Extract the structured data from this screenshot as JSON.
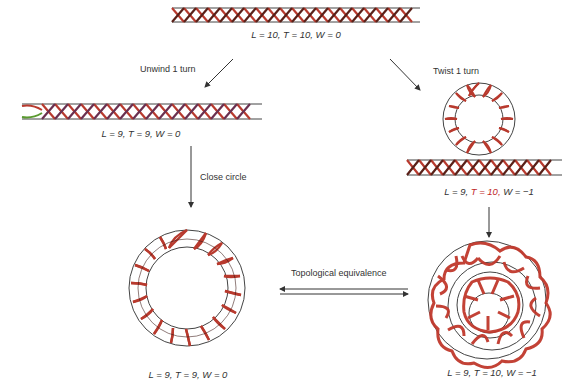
{
  "diagram": {
    "type": "dna-topology",
    "colors": {
      "strand": "#c0282a",
      "strand_dark": "#3a1512",
      "outline": "#444444",
      "text": "#333333",
      "highlight_T": "#c0282a"
    },
    "nodes": {
      "top": {
        "label_L": "L = 10,",
        "label_T": "T = 10,",
        "label_W": "W = 0",
        "shape": "linear-helix"
      },
      "unwound": {
        "label_L": "L = 9,",
        "label_T": "T = 9,",
        "label_W": "W = 0",
        "shape": "linear-helix"
      },
      "twisted": {
        "label_L": "L = 9,",
        "label_T": "T = 10,",
        "label_W": "W = −1",
        "shape": "helix-with-loop"
      },
      "relaxed_circle": {
        "label_L": "L = 9,",
        "label_T": "T = 9,",
        "label_W": "W = 0",
        "shape": "circular-helix"
      },
      "supercoiled_circle": {
        "label_L": "L = 9,",
        "label_T": "T = 10,",
        "label_W": "W = −1",
        "shape": "supercoiled-circle"
      }
    },
    "edges": {
      "unwind": "Unwind 1 turn",
      "twist": "Twist 1 turn",
      "close": "Close circle",
      "equivalence": "Topological equivalence"
    }
  }
}
